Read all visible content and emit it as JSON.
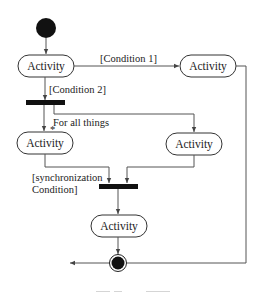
{
  "diagram": {
    "type": "uml-activity-diagram",
    "colors": {
      "line": "#555555",
      "node_fill": "#ffffff",
      "bar": "#111111",
      "text": "#222222"
    },
    "nodes": [
      {
        "id": "start",
        "kind": "initial"
      },
      {
        "id": "a1",
        "kind": "activity",
        "label": "Activity"
      },
      {
        "id": "a2",
        "kind": "activity",
        "label": "Activity"
      },
      {
        "id": "fork",
        "kind": "fork-bar"
      },
      {
        "id": "a3",
        "kind": "activity",
        "label": "Activity"
      },
      {
        "id": "a4",
        "kind": "activity",
        "label": "Activity"
      },
      {
        "id": "join",
        "kind": "join-bar"
      },
      {
        "id": "a5",
        "kind": "activity",
        "label": "Activity"
      },
      {
        "id": "end",
        "kind": "final"
      }
    ],
    "edges": [
      {
        "from": "start",
        "to": "a1"
      },
      {
        "from": "a1",
        "to": "a2",
        "guard": "[Condition 1]"
      },
      {
        "from": "a1",
        "to": "fork",
        "guard": "[Condition 2]"
      },
      {
        "from": "fork",
        "to": "a3",
        "note": "For all things"
      },
      {
        "from": "fork",
        "to": "a4"
      },
      {
        "from": "a3",
        "to": "join",
        "guard": "[synchronization Condition]"
      },
      {
        "from": "a4",
        "to": "join"
      },
      {
        "from": "join",
        "to": "a5"
      },
      {
        "from": "a5",
        "to": "end"
      },
      {
        "from": "a2",
        "to": "end"
      }
    ],
    "labels": {
      "activity_1": "Activity",
      "activity_2": "Activity",
      "activity_3": "Activity",
      "activity_4": "Activity",
      "activity_5": "Activity",
      "condition_1": "[Condition 1]",
      "condition_2": "[Condition 2]",
      "for_all_things": "For all things",
      "sync_line1": "[synchronization",
      "sync_line2": "Condition]"
    }
  }
}
